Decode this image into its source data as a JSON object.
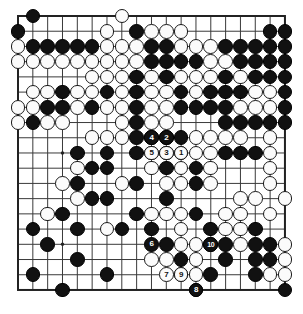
{
  "diagram": {
    "type": "go-board",
    "size": 19,
    "board_color": "#ffffff",
    "line_color": "#3a3a3a",
    "border_color": "#222222",
    "black_color": "#111111",
    "white_color": "#fbfbfb",
    "geometry": {
      "origin_x": 18.0,
      "origin_y": 16.0,
      "step_x": 14.83,
      "step_y": 15.22,
      "stone_radius": 7.3,
      "line_width": 1.0,
      "border_width": 2.0
    },
    "star_points": [
      [
        3,
        3
      ],
      [
        9,
        3
      ],
      [
        15,
        3
      ],
      [
        3,
        9
      ],
      [
        9,
        9
      ],
      [
        15,
        9
      ],
      [
        3,
        15
      ],
      [
        9,
        15
      ],
      [
        15,
        15
      ]
    ],
    "black_stones": [
      [
        1,
        0
      ],
      [
        0,
        1
      ],
      [
        8,
        1
      ],
      [
        17,
        1
      ],
      [
        18,
        1
      ],
      [
        1,
        2
      ],
      [
        2,
        2
      ],
      [
        3,
        2
      ],
      [
        4,
        2
      ],
      [
        5,
        2
      ],
      [
        9,
        2
      ],
      [
        10,
        2
      ],
      [
        14,
        2
      ],
      [
        15,
        2
      ],
      [
        16,
        2
      ],
      [
        17,
        2
      ],
      [
        18,
        2
      ],
      [
        9,
        3
      ],
      [
        10,
        3
      ],
      [
        11,
        3
      ],
      [
        12,
        3
      ],
      [
        15,
        3
      ],
      [
        16,
        3
      ],
      [
        17,
        3
      ],
      [
        18,
        3
      ],
      [
        8,
        4
      ],
      [
        10,
        4
      ],
      [
        14,
        4
      ],
      [
        16,
        4
      ],
      [
        17,
        4
      ],
      [
        18,
        4
      ],
      [
        3,
        5
      ],
      [
        6,
        5
      ],
      [
        8,
        5
      ],
      [
        11,
        5
      ],
      [
        13,
        5
      ],
      [
        14,
        5
      ],
      [
        15,
        5
      ],
      [
        18,
        5
      ],
      [
        2,
        6
      ],
      [
        3,
        6
      ],
      [
        5,
        6
      ],
      [
        8,
        6
      ],
      [
        11,
        6
      ],
      [
        12,
        6
      ],
      [
        13,
        6
      ],
      [
        14,
        6
      ],
      [
        18,
        6
      ],
      [
        1,
        7
      ],
      [
        8,
        7
      ],
      [
        14,
        7
      ],
      [
        15,
        7
      ],
      [
        16,
        7
      ],
      [
        17,
        7
      ],
      [
        18,
        7
      ],
      [
        8,
        8
      ],
      [
        9,
        8
      ],
      [
        10,
        8
      ],
      [
        11,
        8
      ],
      [
        4,
        9
      ],
      [
        6,
        9
      ],
      [
        8,
        9
      ],
      [
        10,
        9
      ],
      [
        11,
        9
      ],
      [
        14,
        9
      ],
      [
        15,
        9
      ],
      [
        16,
        9
      ],
      [
        5,
        10
      ],
      [
        6,
        10
      ],
      [
        10,
        10
      ],
      [
        12,
        10
      ],
      [
        4,
        11
      ],
      [
        8,
        11
      ],
      [
        12,
        11
      ],
      [
        5,
        12
      ],
      [
        6,
        12
      ],
      [
        10,
        12
      ],
      [
        3,
        13
      ],
      [
        8,
        13
      ],
      [
        12,
        13
      ],
      [
        1,
        14
      ],
      [
        7,
        14
      ],
      [
        13,
        14
      ],
      [
        16,
        14
      ],
      [
        4,
        14
      ],
      [
        9,
        14
      ],
      [
        2,
        15
      ],
      [
        10,
        15
      ],
      [
        13,
        15
      ],
      [
        14,
        15
      ],
      [
        16,
        15
      ],
      [
        17,
        15
      ],
      [
        4,
        16
      ],
      [
        11,
        16
      ],
      [
        14,
        16
      ],
      [
        16,
        16
      ],
      [
        17,
        16
      ],
      [
        1,
        17
      ],
      [
        6,
        17
      ],
      [
        13,
        17
      ],
      [
        16,
        17
      ],
      [
        3,
        18
      ],
      [
        12,
        18
      ],
      [
        18,
        18
      ]
    ],
    "white_stones": [
      [
        7,
        0
      ],
      [
        6,
        1
      ],
      [
        9,
        1
      ],
      [
        10,
        1
      ],
      [
        11,
        1
      ],
      [
        0,
        2
      ],
      [
        6,
        2
      ],
      [
        7,
        2
      ],
      [
        8,
        2
      ],
      [
        11,
        2
      ],
      [
        12,
        2
      ],
      [
        13,
        2
      ],
      [
        0,
        3
      ],
      [
        1,
        3
      ],
      [
        2,
        3
      ],
      [
        3,
        3
      ],
      [
        4,
        3
      ],
      [
        5,
        3
      ],
      [
        6,
        3
      ],
      [
        7,
        3
      ],
      [
        8,
        3
      ],
      [
        13,
        3
      ],
      [
        14,
        3
      ],
      [
        5,
        4
      ],
      [
        6,
        4
      ],
      [
        7,
        4
      ],
      [
        9,
        4
      ],
      [
        11,
        4
      ],
      [
        12,
        4
      ],
      [
        13,
        4
      ],
      [
        15,
        4
      ],
      [
        1,
        5
      ],
      [
        2,
        5
      ],
      [
        4,
        5
      ],
      [
        5,
        5
      ],
      [
        7,
        5
      ],
      [
        9,
        5
      ],
      [
        10,
        5
      ],
      [
        12,
        5
      ],
      [
        16,
        5
      ],
      [
        17,
        5
      ],
      [
        0,
        6
      ],
      [
        1,
        6
      ],
      [
        4,
        6
      ],
      [
        6,
        6
      ],
      [
        7,
        6
      ],
      [
        9,
        6
      ],
      [
        10,
        6
      ],
      [
        15,
        6
      ],
      [
        16,
        6
      ],
      [
        17,
        6
      ],
      [
        0,
        7
      ],
      [
        2,
        7
      ],
      [
        3,
        7
      ],
      [
        7,
        7
      ],
      [
        9,
        7
      ],
      [
        10,
        7
      ],
      [
        5,
        8
      ],
      [
        6,
        8
      ],
      [
        7,
        8
      ],
      [
        12,
        8
      ],
      [
        13,
        8
      ],
      [
        14,
        8
      ],
      [
        15,
        8
      ],
      [
        17,
        8
      ],
      [
        9,
        9
      ],
      [
        12,
        9
      ],
      [
        13,
        9
      ],
      [
        17,
        9
      ],
      [
        4,
        10
      ],
      [
        9,
        10
      ],
      [
        11,
        10
      ],
      [
        13,
        10
      ],
      [
        17,
        10
      ],
      [
        3,
        11
      ],
      [
        7,
        11
      ],
      [
        10,
        11
      ],
      [
        11,
        11
      ],
      [
        13,
        11
      ],
      [
        17,
        11
      ],
      [
        4,
        12
      ],
      [
        15,
        12
      ],
      [
        16,
        12
      ],
      [
        18,
        12
      ],
      [
        2,
        13
      ],
      [
        9,
        13
      ],
      [
        10,
        13
      ],
      [
        11,
        13
      ],
      [
        14,
        13
      ],
      [
        15,
        13
      ],
      [
        17,
        13
      ],
      [
        6,
        14
      ],
      [
        11,
        14
      ],
      [
        14,
        14
      ],
      [
        15,
        14
      ],
      [
        11,
        15
      ],
      [
        12,
        15
      ],
      [
        15,
        15
      ],
      [
        18,
        15
      ],
      [
        9,
        16
      ],
      [
        10,
        16
      ],
      [
        12,
        16
      ],
      [
        18,
        16
      ],
      [
        11,
        17
      ],
      [
        12,
        17
      ],
      [
        17,
        17
      ],
      [
        18,
        17
      ]
    ],
    "numbered_moves": [
      {
        "label": "1",
        "color": "white",
        "col": 11,
        "row": 9
      },
      {
        "label": "2",
        "color": "black",
        "col": 10,
        "row": 8
      },
      {
        "label": "3",
        "color": "white",
        "col": 10,
        "row": 9
      },
      {
        "label": "4",
        "color": "black",
        "col": 9,
        "row": 8
      },
      {
        "label": "5",
        "color": "white",
        "col": 9,
        "row": 9
      },
      {
        "label": "6",
        "color": "black",
        "col": 9,
        "row": 15
      },
      {
        "label": "7",
        "color": "white",
        "col": 10,
        "row": 17
      },
      {
        "label": "8",
        "color": "black",
        "col": 12,
        "row": 18
      },
      {
        "label": "9",
        "color": "white",
        "col": 11,
        "row": 17
      },
      {
        "label": "10",
        "color": "black",
        "col": 13,
        "row": 15
      }
    ]
  }
}
